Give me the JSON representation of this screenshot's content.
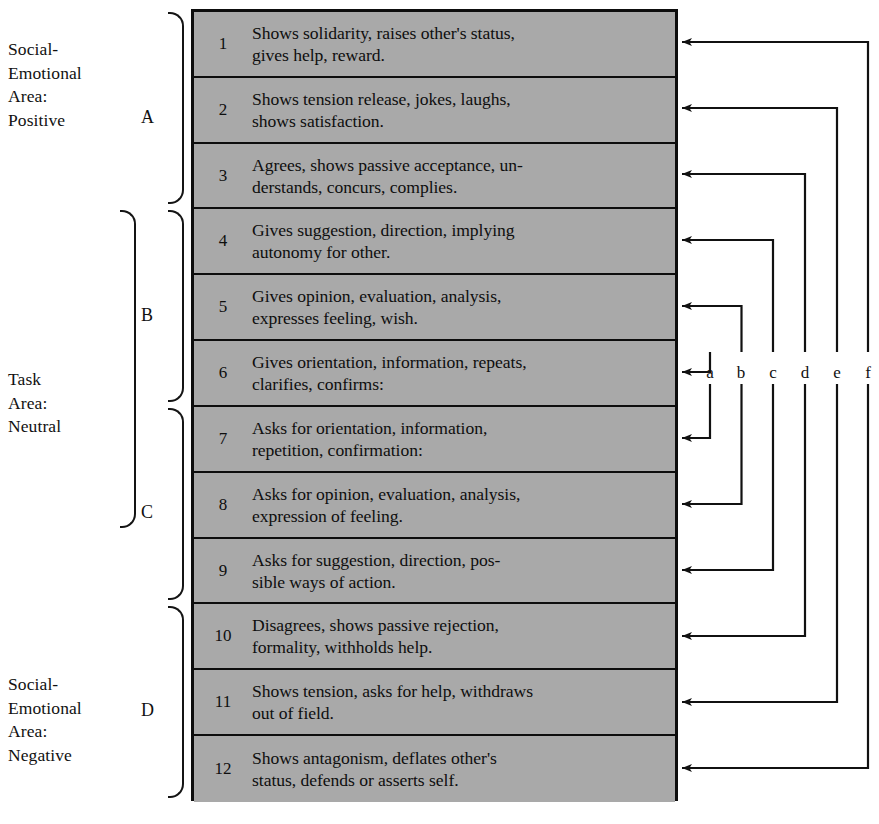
{
  "diagram": {
    "box": {
      "fill_color": "#a9a9a9",
      "border_color": "#0d0d0d"
    }
  },
  "areas": [
    {
      "key": "positive",
      "label": "Social-\nEmotional\nArea:\nPositive",
      "rows": [
        1,
        3
      ]
    },
    {
      "key": "neutral",
      "label": "Task\nArea:\nNeutral",
      "rows": [
        4,
        9
      ]
    },
    {
      "key": "negative",
      "label": "Social-\nEmotional\nArea:\nNegative",
      "rows": [
        10,
        12
      ]
    }
  ],
  "categories": [
    {
      "letter": "A",
      "rows": [
        1,
        3
      ]
    },
    {
      "letter": "B",
      "rows": [
        4,
        6
      ]
    },
    {
      "letter": "C",
      "rows": [
        7,
        9
      ]
    },
    {
      "letter": "D",
      "rows": [
        10,
        12
      ]
    }
  ],
  "rows": [
    {
      "num": "1",
      "text": "Shows solidarity, raises other's status,\ngives help, reward.",
      "lane": "f"
    },
    {
      "num": "2",
      "text": "Shows tension release, jokes, laughs,\nshows satisfaction.",
      "lane": "e"
    },
    {
      "num": "3",
      "text": "Agrees, shows passive acceptance, un-\nderstands, concurs, complies.",
      "lane": "d"
    },
    {
      "num": "4",
      "text": "Gives suggestion, direction, implying\nautonomy for other.",
      "lane": "c"
    },
    {
      "num": "5",
      "text": "Gives opinion, evaluation, analysis,\nexpresses feeling, wish.",
      "lane": "b"
    },
    {
      "num": "6",
      "text": "Gives orientation, information, repeats,\nclarifies, confirms:",
      "lane": "a"
    },
    {
      "num": "7",
      "text": "Asks for orientation, information,\nrepetition, confirmation:",
      "lane": "a"
    },
    {
      "num": "8",
      "text": "Asks for opinion, evaluation, analysis,\nexpression of feeling.",
      "lane": "b"
    },
    {
      "num": "9",
      "text": "Asks for suggestion, direction, pos-\nsible ways of action.",
      "lane": "c"
    },
    {
      "num": "10",
      "text": "Disagrees, shows passive rejection,\nformality, withholds help.",
      "lane": "d"
    },
    {
      "num": "11",
      "text": "Shows tension, asks for help, withdraws\nout of field.",
      "lane": "e"
    },
    {
      "num": "12",
      "text": "Shows antagonism, deflates other's\nstatus, defends or asserts self.",
      "lane": "f"
    }
  ],
  "lanes": [
    {
      "id": "a",
      "label": "a"
    },
    {
      "id": "b",
      "label": "b"
    },
    {
      "id": "c",
      "label": "c"
    },
    {
      "id": "d",
      "label": "d"
    },
    {
      "id": "e",
      "label": "e"
    },
    {
      "id": "f",
      "label": "f"
    }
  ]
}
